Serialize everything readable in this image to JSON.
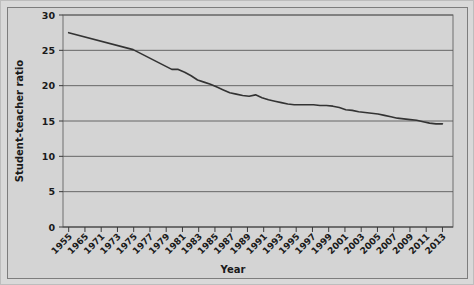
{
  "chart_data": {
    "type": "line",
    "title": "",
    "xlabel": "Year",
    "ylabel": "Student-teacher ratio",
    "xlim": [
      1955,
      2013
    ],
    "ylim": [
      0,
      30
    ],
    "grid": true,
    "legend": "none",
    "y_ticks": [
      0,
      5,
      10,
      15,
      20,
      25,
      30
    ],
    "y_tick_labels": [
      "0",
      "5",
      "10",
      "15",
      "20",
      "25",
      "30"
    ],
    "x_tick_labels": [
      "1955",
      "1965",
      "1971",
      "1973",
      "1975",
      "1977",
      "1979",
      "1981",
      "1983",
      "1985",
      "1987",
      "1989",
      "1991",
      "1993",
      "1995",
      "1997",
      "1999",
      "2001",
      "2003",
      "2005",
      "2007",
      "2009",
      "2011",
      "2013"
    ],
    "series": [
      {
        "name": "Student-teacher ratio",
        "color": "#333333",
        "x": [
          1955,
          1965,
          1971,
          1972,
          1973,
          1974,
          1975,
          1976,
          1977,
          1978,
          1979,
          1980,
          1981,
          1982,
          1983,
          1984,
          1985,
          1986,
          1987,
          1988,
          1989,
          1990,
          1991,
          1992,
          1993,
          1994,
          1995,
          1996,
          1997,
          1998,
          1999,
          2000,
          2001,
          2002,
          2003,
          2004,
          2005,
          2006,
          2007,
          2008,
          2009,
          2010,
          2011,
          2012,
          2013
        ],
        "values": [
          27.5,
          25.1,
          22.3,
          22.3,
          21.9,
          21.4,
          20.8,
          20.5,
          20.2,
          19.8,
          19.4,
          19.0,
          18.8,
          18.6,
          18.5,
          18.7,
          18.3,
          18.0,
          17.8,
          17.6,
          17.4,
          17.3,
          17.3,
          17.3,
          17.3,
          17.2,
          17.2,
          17.1,
          16.9,
          16.6,
          16.5,
          16.3,
          16.2,
          16.1,
          16.0,
          15.8,
          15.6,
          15.4,
          15.3,
          15.2,
          15.1,
          14.9,
          14.7,
          14.6,
          14.6
        ]
      }
    ]
  }
}
